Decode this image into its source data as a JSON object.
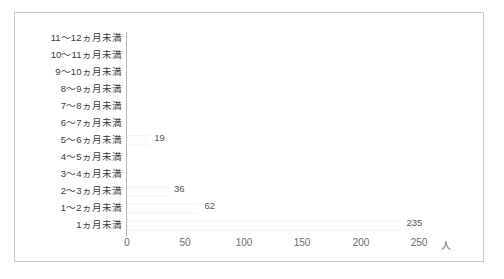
{
  "chart_data": {
    "type": "bar",
    "orientation": "horizontal",
    "title": "",
    "subtitle": "",
    "xlabel": "",
    "ylabel": "",
    "unit": "人",
    "xlim": [
      0,
      250
    ],
    "x_ticks": [
      0,
      50,
      100,
      150,
      200,
      250
    ],
    "x_tick_labels": [
      "0",
      "50",
      "100",
      "150",
      "200",
      "250"
    ],
    "grid": false,
    "legend": null,
    "categories": [
      "11～12ヵ月未満",
      "10～11ヵ月未満",
      "9～10ヵ月未満",
      "8～9ヵ月未満",
      "7～8ヵ月未満",
      "6～7ヵ月未満",
      "5～6ヵ月未満",
      "4～5ヵ月未満",
      "3～4ヵ月未満",
      "2～3ヵ月未満",
      "1～2ヵ月未満",
      "1ヵ月未満"
    ],
    "values": [
      0,
      0,
      0,
      0,
      0,
      0,
      19,
      0,
      0,
      36,
      62,
      235
    ],
    "data_labels": [
      "",
      "",
      "",
      "",
      "",
      "",
      "19",
      "",
      "",
      "36",
      "62",
      "235"
    ],
    "colors": {
      "bar_fill": "#fdfdfd",
      "axis_line": "#b5b5b5",
      "frame_border": "#c9c9c9",
      "category_text": "#3a3a3a",
      "tick_text": "#6b6b6b",
      "value_text": "#555555",
      "background": "#ffffff"
    }
  }
}
